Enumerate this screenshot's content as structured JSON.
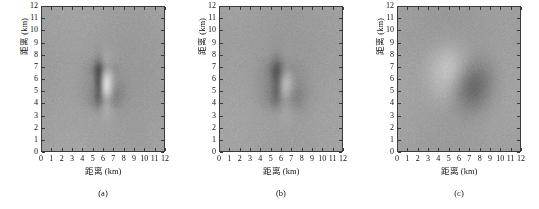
{
  "figure": {
    "panel_count": 3
  },
  "chart_data": {
    "type": "heatmap",
    "title": "",
    "xlabel": "距离 (km)",
    "ylabel": "距离 (km)",
    "xlim": [
      0,
      12
    ],
    "ylim": [
      0,
      12
    ],
    "grid": false,
    "legend": "none",
    "colormap": "gray",
    "background_level": 0.62,
    "panels": [
      {
        "id": "a",
        "caption": "(a)",
        "xlabel": "距离 (km)",
        "ylabel": "距离 (km)",
        "xticks": [
          "0",
          "1",
          "2",
          "3",
          "4",
          "5",
          "6",
          "7",
          "8",
          "9",
          "10",
          "11",
          "12"
        ],
        "yticks": [
          "0",
          "1",
          "2",
          "3",
          "4",
          "5",
          "6",
          "7",
          "8",
          "9",
          "10",
          "11",
          "12"
        ],
        "description": "sharp-focused point target",
        "target": {
          "center_x": 5.9,
          "center_y": 5.6,
          "extent_x": 2.6,
          "extent_y": 3.4,
          "sharpness": 1.0
        },
        "features": [
          {
            "x": 5.55,
            "y": 5.9,
            "sx": 0.3,
            "sy": 1.15,
            "amp": -0.26
          },
          {
            "x": 6.35,
            "y": 5.4,
            "sx": 0.45,
            "sy": 1.3,
            "amp": 0.3
          },
          {
            "x": 5.95,
            "y": 6.9,
            "sx": 0.85,
            "sy": 0.45,
            "amp": -0.14
          },
          {
            "x": 6.05,
            "y": 4.25,
            "sx": 0.95,
            "sy": 0.5,
            "amp": -0.13
          },
          {
            "x": 7.1,
            "y": 5.0,
            "sx": 0.8,
            "sy": 0.8,
            "amp": -0.08
          },
          {
            "x": 4.9,
            "y": 5.4,
            "sx": 0.7,
            "sy": 0.9,
            "amp": -0.05
          }
        ]
      },
      {
        "id": "b",
        "caption": "(b)",
        "xlabel": "距离 (km)",
        "ylabel": "距离 (km)",
        "xticks": [
          "0",
          "1",
          "2",
          "3",
          "4",
          "5",
          "6",
          "7",
          "8",
          "9",
          "10",
          "11",
          "12"
        ],
        "yticks": [
          "0",
          "1",
          "2",
          "3",
          "4",
          "5",
          "6",
          "7",
          "8",
          "9",
          "10",
          "11",
          "12"
        ],
        "description": "partially defocused point target",
        "target": {
          "center_x": 5.9,
          "center_y": 5.6,
          "extent_x": 3.2,
          "extent_y": 3.8,
          "sharpness": 0.6
        },
        "features": [
          {
            "x": 5.6,
            "y": 5.9,
            "sx": 0.42,
            "sy": 1.25,
            "amp": -0.22
          },
          {
            "x": 6.35,
            "y": 5.3,
            "sx": 0.6,
            "sy": 1.35,
            "amp": 0.22
          },
          {
            "x": 6.0,
            "y": 6.9,
            "sx": 1.05,
            "sy": 0.6,
            "amp": -0.12
          },
          {
            "x": 6.1,
            "y": 4.3,
            "sx": 1.1,
            "sy": 0.65,
            "amp": -0.11
          },
          {
            "x": 7.3,
            "y": 4.9,
            "sx": 1.0,
            "sy": 1.0,
            "amp": -0.08
          },
          {
            "x": 4.8,
            "y": 5.5,
            "sx": 0.9,
            "sy": 1.0,
            "amp": -0.05
          }
        ]
      },
      {
        "id": "c",
        "caption": "(c)",
        "xlabel": "距离 (km)",
        "ylabel": "距离 (km)",
        "xticks": [
          "0",
          "1",
          "2",
          "3",
          "4",
          "5",
          "6",
          "7",
          "8",
          "9",
          "10",
          "11",
          "12"
        ],
        "yticks": [
          "0",
          "1",
          "2",
          "3",
          "4",
          "5",
          "6",
          "7",
          "8",
          "9",
          "10",
          "11",
          "12"
        ],
        "description": "strongly defocused / smeared point target",
        "target": {
          "center_x": 6.1,
          "center_y": 6.0,
          "extent_x": 5.0,
          "extent_y": 5.0,
          "sharpness": 0.2
        },
        "features": [
          {
            "x": 5.1,
            "y": 6.9,
            "sx": 1.45,
            "sy": 1.35,
            "amp": 0.17
          },
          {
            "x": 7.2,
            "y": 5.1,
            "sx": 1.35,
            "sy": 1.3,
            "amp": -0.17
          },
          {
            "x": 6.2,
            "y": 6.0,
            "sx": 1.9,
            "sy": 1.8,
            "amp": -0.03
          },
          {
            "x": 7.8,
            "y": 6.4,
            "sx": 1.2,
            "sy": 1.1,
            "amp": -0.07
          },
          {
            "x": 4.6,
            "y": 5.0,
            "sx": 1.2,
            "sy": 1.1,
            "amp": 0.05
          }
        ]
      }
    ]
  }
}
